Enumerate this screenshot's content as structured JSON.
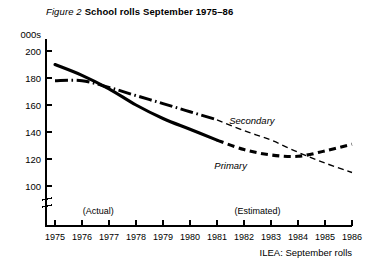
{
  "title": {
    "figure_number": "Figure 2",
    "text": "School rolls September 1975–86"
  },
  "source": "ILEA:  September rolls",
  "axis": {
    "y_units": "000s",
    "y_ticks": [
      "200",
      "180",
      "160",
      "140",
      "120",
      "100"
    ],
    "x_ticks": [
      "1975",
      "1976",
      "1977",
      "1978",
      "1979",
      "1980",
      "1981",
      "1982",
      "1983",
      "1984",
      "1985",
      "1986"
    ],
    "has_break": true
  },
  "phases": [
    {
      "label": "(Actual)",
      "year": 1976.6
    },
    {
      "label": "(Estimated)",
      "year": 1982.5
    }
  ],
  "series_labels": {
    "secondary": "Secondary",
    "primary": "Primary"
  },
  "chart_data": {
    "type": "line",
    "subtitle": "",
    "xlabel": "",
    "ylabel": "000s",
    "xlim": [
      1975,
      1986
    ],
    "ylim": [
      95,
      205
    ],
    "yticks": [
      100,
      120,
      140,
      160,
      180,
      200
    ],
    "xticks": [
      1975,
      1976,
      1977,
      1978,
      1979,
      1980,
      1981,
      1982,
      1983,
      1984,
      1985,
      1986
    ],
    "grid": false,
    "legend": "inline-annotations",
    "axis_break_below": 100,
    "x": [
      1975,
      1976,
      1977,
      1978,
      1979,
      1980,
      1981,
      1982,
      1983,
      1984,
      1985,
      1986
    ],
    "series": [
      {
        "name": "Primary",
        "style": "thick-solid-then-thick-dashed",
        "actual_through": 1981,
        "values": [
          190,
          182,
          172,
          160,
          150,
          142,
          134,
          127,
          123,
          122,
          126,
          131
        ]
      },
      {
        "name": "Secondary",
        "style": "thick-dash-dot-then-thin-dashed",
        "actual_through": 1981,
        "values": [
          178,
          178,
          173,
          167,
          161,
          155,
          149,
          141,
          134,
          125,
          117,
          110
        ]
      }
    ],
    "annotations": [
      {
        "text": "(Actual)",
        "x": 1976.6,
        "y": 103
      },
      {
        "text": "(Estimated)",
        "x": 1982.5,
        "y": 103
      },
      {
        "text": "Secondary",
        "x": 1981.6,
        "y": 152
      },
      {
        "text": "Primary",
        "x": 1981.1,
        "y": 117
      }
    ]
  }
}
